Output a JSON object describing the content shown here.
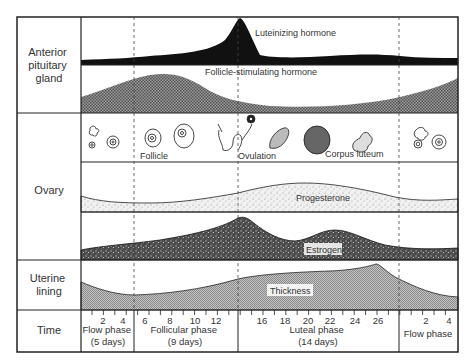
{
  "row_labels": {
    "pituitary": [
      "Anterior",
      "pituitary",
      "gland"
    ],
    "ovary": "Ovary",
    "uterine": [
      "Uterine",
      "lining"
    ],
    "time": "Time"
  },
  "curve_labels": {
    "lh": "Luteinizing hormone",
    "fsh": "Follicle-stimulating hormone",
    "progesterone": "Progesterone",
    "estrogen": "Estrogen",
    "thickness": "Thickness"
  },
  "ovary_stages": {
    "follicle": "Follicle",
    "ovulation": "Ovulation",
    "corpus_luteum": "Corpus luteum"
  },
  "phases": [
    {
      "name": "Flow phase",
      "duration": "(5 days)"
    },
    {
      "name": "Follicular phase",
      "duration": "(9 days)"
    },
    {
      "name": "Luteal phase",
      "duration": "(14 days)"
    },
    {
      "name": "Flow phase",
      "duration": ""
    }
  ],
  "day_ticks": [
    {
      "label": "2",
      "x": 103
    },
    {
      "label": "4",
      "x": 123
    },
    {
      "label": "6",
      "x": 145
    },
    {
      "label": "8",
      "x": 170
    },
    {
      "label": "10",
      "x": 195
    },
    {
      "label": "12",
      "x": 216
    },
    {
      "label": "16",
      "x": 262
    },
    {
      "label": "18",
      "x": 285
    },
    {
      "label": "20",
      "x": 308
    },
    {
      "label": "22",
      "x": 330
    },
    {
      "label": "24",
      "x": 355
    },
    {
      "label": "26",
      "x": 378
    },
    {
      "label": "2",
      "x": 426
    },
    {
      "label": "4",
      "x": 449
    }
  ],
  "colors": {
    "ink": "#111111",
    "frame": "#222222",
    "dashed": "#444444",
    "shade_dark": "#3a3a3a",
    "shade_mid": "#8a8a8a",
    "shade_light": "#e2e2e2"
  }
}
